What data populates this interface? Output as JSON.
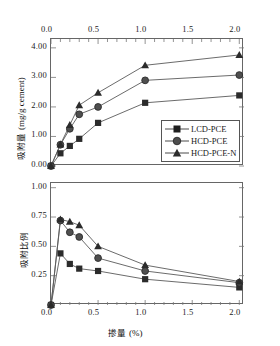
{
  "chart_data": [
    {
      "id": "top",
      "type": "line",
      "title": "",
      "xlabel": "",
      "ylabel": "吸附量 (mg/g cement)",
      "ylabel_cjk": "吸附量",
      "ylabel_unit": "(mg/g cement)",
      "x": [
        0.0,
        0.1,
        0.2,
        0.3,
        0.5,
        1.0,
        2.0
      ],
      "xlim": [
        0.0,
        2.05
      ],
      "ylim": [
        0.0,
        4.3
      ],
      "xticks": [
        "0.0",
        "0.5",
        "1.0",
        "1.5",
        "2.0"
      ],
      "xtickvals": [
        0.0,
        0.5,
        1.0,
        1.5,
        2.0
      ],
      "yticks": [
        "0.00",
        "1.00",
        "2.00",
        "3.00",
        "4.00"
      ],
      "ytickvals": [
        0.0,
        1.0,
        2.0,
        3.0,
        4.0
      ],
      "xaxis_position": "top",
      "grid": false,
      "series": [
        {
          "name": "LCD-PCE",
          "marker": "square",
          "values": [
            0.0,
            0.43,
            0.68,
            0.92,
            1.46,
            2.14,
            2.39
          ]
        },
        {
          "name": "HCD-PCE",
          "marker": "circle",
          "values": [
            0.0,
            0.72,
            1.26,
            1.75,
            2.0,
            2.9,
            3.08
          ]
        },
        {
          "name": "HCD-PCE-N",
          "marker": "triangle",
          "values": [
            0.0,
            0.73,
            1.39,
            2.06,
            2.48,
            3.41,
            3.76
          ]
        }
      ]
    },
    {
      "id": "bottom",
      "type": "line",
      "title": "",
      "xlabel": "掺量 (%)",
      "xlabel_cjk": "掺量",
      "xlabel_unit": "(%)",
      "ylabel": "吸附比例",
      "ylabel_cjk": "吸附比例",
      "x": [
        0.0,
        0.1,
        0.2,
        0.3,
        0.5,
        1.0,
        2.0
      ],
      "xlim": [
        0.0,
        2.05
      ],
      "ylim": [
        0.0,
        1.04
      ],
      "xticks": [
        "0.0",
        "0.5",
        "1.0",
        "1.5",
        "2.0"
      ],
      "xtickvals": [
        0.0,
        0.5,
        1.0,
        1.5,
        2.0
      ],
      "yticks": [
        "0.25",
        "0.50",
        "0.75",
        "1.00"
      ],
      "ytickvals": [
        0.25,
        0.5,
        0.75,
        1.0
      ],
      "xaxis_position": "bottom",
      "grid": false,
      "series": [
        {
          "name": "LCD-PCE",
          "marker": "square",
          "values": [
            0.0,
            0.44,
            0.35,
            0.31,
            0.29,
            0.22,
            0.15
          ]
        },
        {
          "name": "HCD-PCE",
          "marker": "circle",
          "values": [
            0.0,
            0.72,
            0.62,
            0.58,
            0.4,
            0.29,
            0.19
          ]
        },
        {
          "name": "HCD-PCE-N",
          "marker": "triangle",
          "values": [
            0.0,
            0.73,
            0.71,
            0.68,
            0.5,
            0.34,
            0.2
          ]
        }
      ]
    }
  ],
  "legend": {
    "position": "inside-bottom-right-top-panel",
    "entries": [
      {
        "label": "LCD-PCE",
        "marker": "square"
      },
      {
        "label": "HCD-PCE",
        "marker": "circle"
      },
      {
        "label": "HCD-PCE-N",
        "marker": "triangle"
      }
    ]
  },
  "style": {
    "line_color": "#5a5a5a",
    "marker_color": "#2b2b2b",
    "axis_color": "#666666",
    "text_color": "#1a1a1a",
    "background": "#ffffff"
  }
}
